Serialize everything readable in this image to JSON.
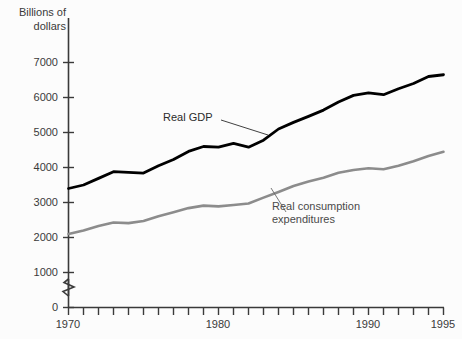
{
  "chart_data": {
    "type": "line",
    "title": "",
    "ylabel": "Billions of\ndollars",
    "xlabel": "",
    "xlim": [
      1970,
      1995
    ],
    "ylim": [
      0,
      7400
    ],
    "grid": false,
    "legend_position": "inline-annotations",
    "y_ticks": [
      0,
      1000,
      2000,
      3000,
      4000,
      5000,
      6000,
      7000
    ],
    "y_tick_labels": [
      "0",
      "1000",
      "2000",
      "3000",
      "4000",
      "5000",
      "6000",
      "7000"
    ],
    "y_axis_break": true,
    "x_ticks": [
      1970,
      1971,
      1972,
      1973,
      1974,
      1975,
      1976,
      1977,
      1978,
      1979,
      1980,
      1981,
      1982,
      1983,
      1984,
      1985,
      1986,
      1987,
      1988,
      1989,
      1990,
      1991,
      1992,
      1993,
      1994,
      1995
    ],
    "x_tick_labels": [
      "1970",
      "1980",
      "1990",
      "1995"
    ],
    "x_labeled_ticks": [
      1970,
      1980,
      1990,
      1995
    ],
    "x": [
      1970,
      1971,
      1972,
      1973,
      1974,
      1975,
      1976,
      1977,
      1978,
      1979,
      1980,
      1981,
      1982,
      1983,
      1984,
      1985,
      1986,
      1987,
      1988,
      1989,
      1990,
      1991,
      1992,
      1993,
      1994,
      1995
    ],
    "series": [
      {
        "name": "Real GDP",
        "color": "#000000",
        "values": [
          3400,
          3500,
          3690,
          3880,
          3860,
          3840,
          4050,
          4230,
          4460,
          4600,
          4580,
          4690,
          4580,
          4780,
          5100,
          5290,
          5460,
          5640,
          5870,
          6060,
          6130,
          6080,
          6250,
          6400,
          6600,
          6650
        ]
      },
      {
        "name": "Real consumption\nexpenditures",
        "color": "#8c8c8c",
        "values": [
          2100,
          2200,
          2330,
          2430,
          2410,
          2470,
          2610,
          2720,
          2840,
          2910,
          2890,
          2930,
          2970,
          3140,
          3300,
          3470,
          3600,
          3710,
          3850,
          3930,
          3980,
          3950,
          4050,
          4180,
          4330,
          4450
        ]
      }
    ],
    "annotations": [
      {
        "text": "Real GDP",
        "series": "Real GDP"
      },
      {
        "text": "Real consumption\nexpenditures",
        "series": "Real consumption expenditures"
      }
    ]
  },
  "labels": {
    "y_axis_title": "Billions of\ndollars",
    "gdp": "Real GDP",
    "consumption": "Real consumption\nexpenditures",
    "y0": "0",
    "y1000": "1000",
    "y2000": "2000",
    "y3000": "3000",
    "y4000": "4000",
    "y5000": "5000",
    "y6000": "6000",
    "y7000": "7000",
    "x1970": "1970",
    "x1980": "1980",
    "x1990": "1990",
    "x1995": "1995"
  },
  "colors": {
    "gdp_line": "#000000",
    "consumption_line": "#8c8c8c",
    "axis": "#3a3a3a",
    "background": "#fcfcfc",
    "text": "#3a3a3a"
  }
}
